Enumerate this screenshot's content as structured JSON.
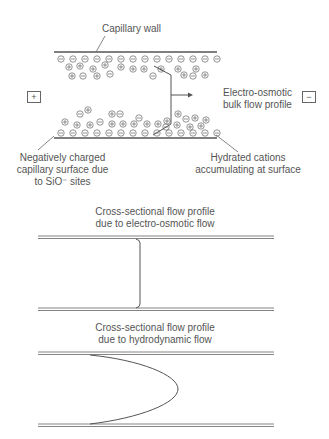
{
  "top_diagram": {
    "capillary_wall_label": "Capillary wall",
    "anode_symbol": "+",
    "cathode_symbol": "−",
    "electroosmotic_label_line1": "Electro-osmotic",
    "electroosmotic_label_line2": "bulk flow profile",
    "negative_surface_label_line1": "Negatively charged",
    "negative_surface_label_line2": "capillary surface due",
    "negative_surface_label_line3": "to SiO⁻ sites",
    "cations_label_line1": "Hydrated cations",
    "cations_label_line2": "accumulating at surface",
    "anion_symbol": "⊖",
    "cation_symbol": "⊕",
    "colors": {
      "line": "#555555",
      "text": "#555555"
    }
  },
  "eof_profile": {
    "title_line1": "Cross-sectional flow profile",
    "title_line2": "due to electro-osmotic flow",
    "profile_shape": "flat"
  },
  "hydrodynamic_profile": {
    "title_line1": "Cross-sectional flow profile",
    "title_line2": "due to hydrodynamic flow",
    "profile_shape": "parabolic"
  }
}
